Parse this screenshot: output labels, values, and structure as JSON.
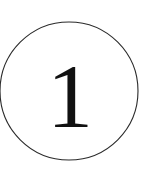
{
  "badge": {
    "numeral": "1",
    "shape": "circle-outline",
    "stroke_color": "#2b2b2b",
    "numeral_color": "#111111",
    "background_color": "#ffffff",
    "circle": {
      "center_x": 69,
      "center_y": 91,
      "radius": 69,
      "stroke_width": 1.1
    },
    "numeral_position": {
      "x": 70,
      "y": 93
    }
  }
}
